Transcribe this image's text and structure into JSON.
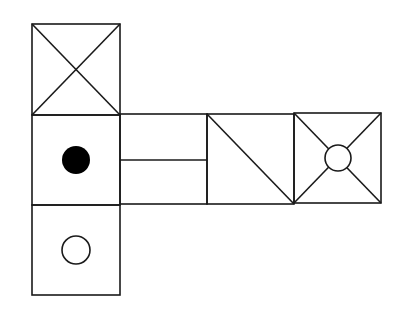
{
  "diagram": {
    "type": "cube-net",
    "stroke_color": "#1a1a1a",
    "background": "#ffffff",
    "faces": [
      {
        "id": "top",
        "position": "column-top",
        "marking": "X (both diagonals)"
      },
      {
        "id": "center",
        "position": "column-middle",
        "marking": "filled black dot"
      },
      {
        "id": "bottom",
        "position": "column-bottom",
        "marking": "hollow circle"
      },
      {
        "id": "right-1",
        "position": "row-1",
        "marking": "horizontal line across middle"
      },
      {
        "id": "right-2",
        "position": "row-2",
        "marking": "single diagonal from top-left to bottom-right"
      },
      {
        "id": "right-3",
        "position": "row-3",
        "marking": "X (both diagonals) with hollow circle at center"
      }
    ]
  }
}
